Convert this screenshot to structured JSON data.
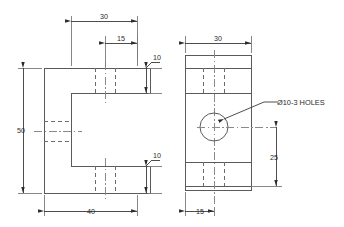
{
  "drawing": {
    "title": "C-Bracket Orthographic Drawing",
    "units": "mm",
    "line_colors": {
      "object": "#5a5a5a",
      "hidden": "#6b6b6b",
      "center": "#8a8a8a",
      "dimension": "#3a3a3a",
      "extension": "#7a7a7a",
      "text": "#2b2b2b",
      "background": "#ffffff"
    },
    "views": [
      {
        "id": "front-view",
        "name": "front-view",
        "label": "Front View",
        "shape": "C-channel profile",
        "dimensions": [
          {
            "id": "front-top-30",
            "value": "30",
            "orientation": "horizontal",
            "position": "top"
          },
          {
            "id": "front-top-15",
            "value": "15",
            "orientation": "horizontal",
            "position": "top-inner"
          },
          {
            "id": "front-right-upper-10",
            "value": "10",
            "orientation": "vertical",
            "position": "right-upper"
          },
          {
            "id": "front-right-lower-10",
            "value": "10",
            "orientation": "vertical",
            "position": "right-lower"
          },
          {
            "id": "front-left-50",
            "value": "50",
            "orientation": "vertical",
            "position": "left"
          },
          {
            "id": "front-bottom-40",
            "value": "40",
            "orientation": "horizontal",
            "position": "bottom"
          }
        ]
      },
      {
        "id": "side-view",
        "name": "side-view",
        "label": "Side View",
        "shape": "rectangular plate with through hole",
        "dimensions": [
          {
            "id": "side-top-30",
            "value": "30",
            "orientation": "horizontal",
            "position": "top"
          },
          {
            "id": "side-right-25",
            "value": "25",
            "orientation": "vertical",
            "position": "right"
          },
          {
            "id": "side-bottom-15",
            "value": "15",
            "orientation": "horizontal",
            "position": "bottom"
          }
        ],
        "notes": [
          {
            "id": "hole-note",
            "text": "Ø10-3 HOLES",
            "leader_target": "center-hole"
          }
        ]
      }
    ]
  }
}
